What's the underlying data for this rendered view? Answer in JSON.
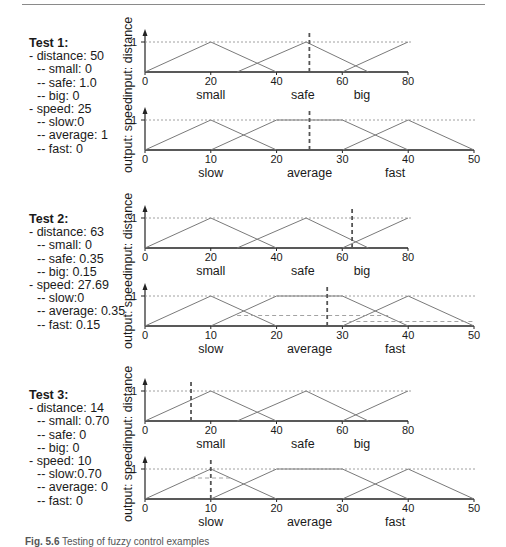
{
  "caption": {
    "label": "Fig. 5.6",
    "text": "Testing of fuzzy control examples"
  },
  "axis_labels": {
    "distance": "input: distance",
    "speed": "output: speed",
    "one": "1"
  },
  "distance_ticks": [
    "0",
    "20",
    "40",
    "60",
    "80"
  ],
  "speed_ticks": [
    "0",
    "10",
    "20",
    "30",
    "40",
    "50"
  ],
  "distance_sets": [
    "small",
    "safe",
    "big"
  ],
  "speed_sets": [
    "slow",
    "average",
    "fast"
  ],
  "tests": [
    {
      "title": "Test 1:",
      "lines": [
        {
          "text": "- distance: 50",
          "level": 1
        },
        {
          "text": "-- small: 0",
          "level": 2
        },
        {
          "text": "-- safe: 1.0",
          "level": 2
        },
        {
          "text": "-- big: 0",
          "level": 2
        },
        {
          "text": "- speed: 25",
          "level": 1
        },
        {
          "text": "-- slow:0",
          "level": 2
        },
        {
          "text": "-- average: 1",
          "level": 2
        },
        {
          "text": "-- fast: 0",
          "level": 2
        }
      ]
    },
    {
      "title": "Test 2:",
      "lines": [
        {
          "text": "- distance: 63",
          "level": 1
        },
        {
          "text": "-- small: 0",
          "level": 2
        },
        {
          "text": "-- safe: 0.35",
          "level": 2
        },
        {
          "text": "-- big: 0.15",
          "level": 2
        },
        {
          "text": "- speed: 27.69",
          "level": 1
        },
        {
          "text": "-- slow:0",
          "level": 2
        },
        {
          "text": "-- average: 0.35",
          "level": 2
        },
        {
          "text": "-- fast: 0.15",
          "level": 2
        }
      ]
    },
    {
      "title": "Test 3:",
      "lines": [
        {
          "text": "- distance: 14",
          "level": 1
        },
        {
          "text": "-- small: 0.70",
          "level": 2
        },
        {
          "text": "-- safe: 0",
          "level": 2
        },
        {
          "text": "-- big: 0",
          "level": 2
        },
        {
          "text": "- speed: 10",
          "level": 1
        },
        {
          "text": "-- slow:0.70",
          "level": 2
        },
        {
          "text": "-- average: 0",
          "level": 2
        },
        {
          "text": "-- fast: 0",
          "level": 2
        }
      ]
    }
  ],
  "chart_data": [
    {
      "type": "line",
      "title": "Test 1 - input: distance",
      "xlabel": "",
      "ylabel": "input: distance",
      "xlim": [
        0,
        80
      ],
      "ylim": [
        0,
        1
      ],
      "x_ticks": [
        0,
        20,
        40,
        60,
        80
      ],
      "series": [
        {
          "name": "small",
          "points": [
            [
              0,
              0
            ],
            [
              20,
              1
            ],
            [
              40,
              0
            ]
          ]
        },
        {
          "name": "safe",
          "points": [
            [
              28,
              0
            ],
            [
              49,
              1
            ],
            [
              68,
              0
            ]
          ]
        },
        {
          "name": "big",
          "points": [
            [
              60,
              0
            ],
            [
              80,
              1
            ]
          ]
        }
      ],
      "crisp_input": 50,
      "annotations": [
        "dashed line at y=1",
        "dashed vertical marker at distance 50"
      ]
    },
    {
      "type": "line",
      "title": "Test 1 - output: speed",
      "xlabel": "",
      "ylabel": "output: speed",
      "xlim": [
        0,
        50
      ],
      "ylim": [
        0,
        1
      ],
      "x_ticks": [
        0,
        10,
        20,
        30,
        40,
        50
      ],
      "series": [
        {
          "name": "slow",
          "points": [
            [
              0,
              0
            ],
            [
              10,
              1
            ],
            [
              20,
              0
            ]
          ]
        },
        {
          "name": "average",
          "points": [
            [
              10,
              0
            ],
            [
              20,
              1
            ],
            [
              30,
              1
            ],
            [
              40,
              0
            ]
          ]
        },
        {
          "name": "fast",
          "points": [
            [
              30,
              0
            ],
            [
              40,
              1
            ],
            [
              50,
              0
            ]
          ]
        }
      ],
      "crisp_output": 25,
      "clip_levels": [],
      "annotations": [
        "dashed line at y=1",
        "dashed vertical marker at speed 25"
      ]
    },
    {
      "type": "line",
      "title": "Test 2 - input: distance",
      "xlabel": "",
      "ylabel": "input: distance",
      "xlim": [
        0,
        80
      ],
      "ylim": [
        0,
        1
      ],
      "x_ticks": [
        0,
        20,
        40,
        60,
        80
      ],
      "series": [
        {
          "name": "small",
          "points": [
            [
              0,
              0
            ],
            [
              20,
              1
            ],
            [
              40,
              0
            ]
          ]
        },
        {
          "name": "safe",
          "points": [
            [
              28,
              0
            ],
            [
              49,
              1
            ],
            [
              68,
              0
            ]
          ]
        },
        {
          "name": "big",
          "points": [
            [
              60,
              0
            ],
            [
              80,
              1
            ]
          ]
        }
      ],
      "crisp_input": 63,
      "annotations": [
        "dashed line at y=1",
        "dashed vertical marker at distance 63"
      ]
    },
    {
      "type": "line",
      "title": "Test 2 - output: speed",
      "xlabel": "",
      "ylabel": "output: speed",
      "xlim": [
        0,
        50
      ],
      "ylim": [
        0,
        1
      ],
      "x_ticks": [
        0,
        10,
        20,
        30,
        40,
        50
      ],
      "series": [
        {
          "name": "slow",
          "points": [
            [
              0,
              0
            ],
            [
              10,
              1
            ],
            [
              20,
              0
            ]
          ]
        },
        {
          "name": "average",
          "points": [
            [
              10,
              0
            ],
            [
              20,
              1
            ],
            [
              30,
              1
            ],
            [
              40,
              0
            ]
          ]
        },
        {
          "name": "fast",
          "points": [
            [
              30,
              0
            ],
            [
              40,
              1
            ],
            [
              50,
              0
            ]
          ]
        }
      ],
      "crisp_output": 27.69,
      "clip_levels": [
        {
          "set": "average",
          "level": 0.35,
          "x_range": [
            14,
            37
          ]
        },
        {
          "set": "fast",
          "level": 0.15,
          "x_range": [
            30,
            50
          ]
        }
      ],
      "annotations": [
        "dashed line at y=1",
        "dashed vertical marker at speed 27.69"
      ]
    },
    {
      "type": "line",
      "title": "Test 3 - input: distance",
      "xlabel": "",
      "ylabel": "input: distance",
      "xlim": [
        0,
        80
      ],
      "ylim": [
        0,
        1
      ],
      "x_ticks": [
        0,
        20,
        40,
        60,
        80
      ],
      "series": [
        {
          "name": "small",
          "points": [
            [
              0,
              0
            ],
            [
              20,
              1
            ],
            [
              40,
              0
            ]
          ]
        },
        {
          "name": "safe",
          "points": [
            [
              28,
              0
            ],
            [
              49,
              1
            ],
            [
              68,
              0
            ]
          ]
        },
        {
          "name": "big",
          "points": [
            [
              60,
              0
            ],
            [
              80,
              1
            ]
          ]
        }
      ],
      "crisp_input": 14,
      "annotations": [
        "dashed line at y=1",
        "dashed vertical marker at distance 14"
      ]
    },
    {
      "type": "line",
      "title": "Test 3 - output: speed",
      "xlabel": "",
      "ylabel": "output: speed",
      "xlim": [
        0,
        50
      ],
      "ylim": [
        0,
        1
      ],
      "x_ticks": [
        0,
        10,
        20,
        30,
        40,
        50
      ],
      "series": [
        {
          "name": "slow",
          "points": [
            [
              0,
              0
            ],
            [
              10,
              1
            ],
            [
              20,
              0
            ]
          ]
        },
        {
          "name": "average",
          "points": [
            [
              10,
              0
            ],
            [
              20,
              1
            ],
            [
              30,
              1
            ],
            [
              40,
              0
            ]
          ]
        },
        {
          "name": "fast",
          "points": [
            [
              30,
              0
            ],
            [
              40,
              1
            ],
            [
              50,
              0
            ]
          ]
        }
      ],
      "crisp_output": 10,
      "clip_levels": [
        {
          "set": "slow",
          "level": 0.7,
          "x_range": [
            7,
            13
          ]
        }
      ],
      "annotations": [
        "dashed line at y=1",
        "dashed vertical marker at speed 10"
      ]
    }
  ]
}
